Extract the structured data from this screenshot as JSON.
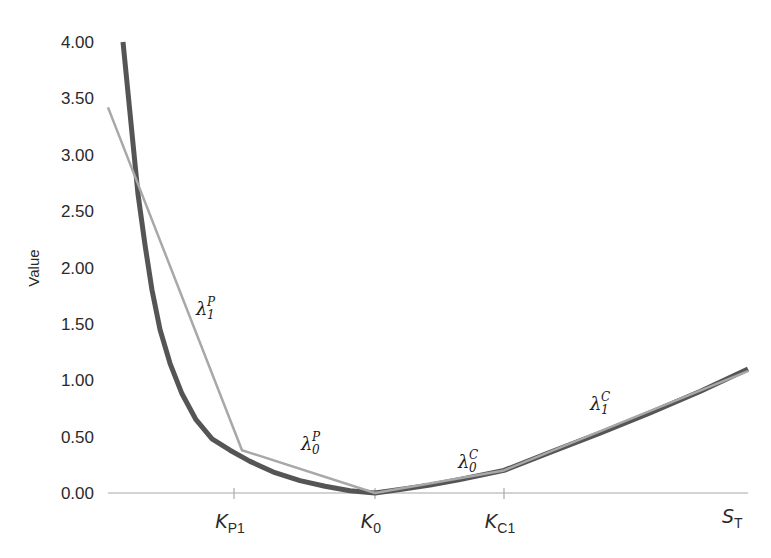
{
  "chart_data": {
    "type": "line",
    "title": "",
    "xlabel": "S_T",
    "ylabel": "Value",
    "ylim": [
      0,
      4
    ],
    "yticks": [
      "0.00",
      "0.50",
      "1.00",
      "1.50",
      "2.00",
      "2.50",
      "3.00",
      "3.50",
      "4.00"
    ],
    "xticks": [
      {
        "label_main": "K",
        "label_sub": "P1",
        "x_px": 234
      },
      {
        "label_main": "K",
        "label_sub": "0",
        "x_px": 375
      },
      {
        "label_main": "K",
        "label_sub": "C1",
        "x_px": 504
      }
    ],
    "x_end_label": {
      "main": "S",
      "sub": "T"
    },
    "grid": false,
    "legend": "none",
    "series": [
      {
        "name": "Convex payoff curve",
        "color": "#555555",
        "width": 5,
        "points_px_value": [
          [
            123,
            4.0
          ],
          [
            128,
            3.55
          ],
          [
            133,
            3.1
          ],
          [
            138,
            2.65
          ],
          [
            145,
            2.2
          ],
          [
            152,
            1.8
          ],
          [
            160,
            1.45
          ],
          [
            170,
            1.15
          ],
          [
            182,
            0.88
          ],
          [
            196,
            0.65
          ],
          [
            212,
            0.48
          ],
          [
            230,
            0.38
          ],
          [
            250,
            0.28
          ],
          [
            275,
            0.18
          ],
          [
            300,
            0.11
          ],
          [
            325,
            0.06
          ],
          [
            350,
            0.02
          ],
          [
            375,
            0.0
          ],
          [
            400,
            0.03
          ],
          [
            430,
            0.07
          ],
          [
            460,
            0.12
          ],
          [
            504,
            0.2
          ],
          [
            550,
            0.36
          ],
          [
            600,
            0.53
          ],
          [
            650,
            0.71
          ],
          [
            700,
            0.9
          ],
          [
            748,
            1.1
          ]
        ]
      },
      {
        "name": "Piecewise linear approximation",
        "color": "#a8a8a8",
        "width": 2.5,
        "points_px_value": [
          [
            108,
            3.42
          ],
          [
            242,
            0.38
          ],
          [
            375,
            0.0
          ],
          [
            504,
            0.2
          ],
          [
            748,
            1.08
          ]
        ]
      }
    ],
    "annotations": [
      {
        "base": "λ",
        "sup": "P",
        "sub": "1",
        "x_px": 196,
        "y_px": 315
      },
      {
        "base": "λ",
        "sup": "P",
        "sub": "0",
        "x_px": 301,
        "y_px": 450
      },
      {
        "base": "λ",
        "sup": "C",
        "sub": "0",
        "x_px": 458,
        "y_px": 468
      },
      {
        "base": "λ",
        "sup": "C",
        "sub": "1",
        "x_px": 590,
        "y_px": 410
      }
    ]
  }
}
